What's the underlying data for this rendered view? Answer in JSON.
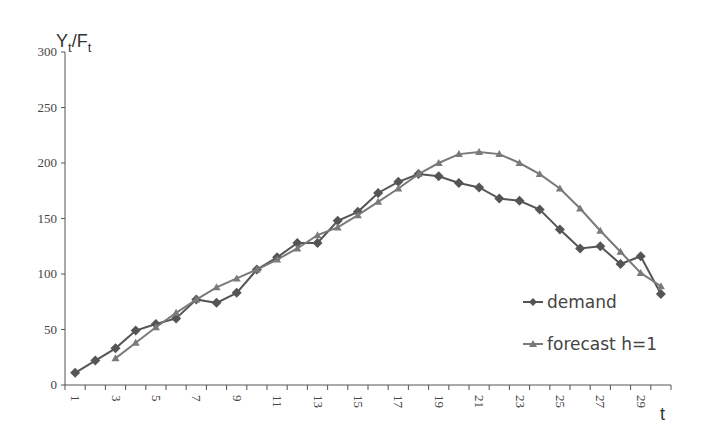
{
  "chart_data": {
    "type": "line",
    "title": "",
    "ylabel": "Y_t/F_t",
    "ylabel_main": "Y",
    "ylabel_sub1": "t",
    "ylabel_sep": "/F",
    "ylabel_sub2": "t",
    "xlabel": "t",
    "ylim": [
      0,
      300
    ],
    "yticks": [
      0,
      50,
      100,
      150,
      200,
      250,
      300
    ],
    "xticks_labeled": [
      1,
      3,
      5,
      7,
      9,
      11,
      13,
      15,
      17,
      19,
      21,
      23,
      25,
      27,
      29
    ],
    "x": [
      1,
      2,
      3,
      4,
      5,
      6,
      7,
      8,
      9,
      10,
      11,
      12,
      13,
      14,
      15,
      16,
      17,
      18,
      19,
      20,
      21,
      22,
      23,
      24,
      25,
      26,
      27,
      28,
      29,
      30
    ],
    "grid": false,
    "legend_position": "right-inside-bottom",
    "series": [
      {
        "name": "demand",
        "marker": "diamond",
        "color": "#555555",
        "values": [
          11,
          22,
          33,
          49,
          55,
          60,
          77,
          74,
          83,
          104,
          115,
          128,
          128,
          148,
          156,
          173,
          183,
          190,
          188,
          182,
          178,
          168,
          166,
          158,
          140,
          123,
          125,
          109,
          116,
          82
        ]
      },
      {
        "name": "forecast h=1",
        "marker": "triangle",
        "color": "#7a7a7a",
        "values": [
          null,
          null,
          24,
          38,
          52,
          65,
          77,
          88,
          96,
          104,
          113,
          123,
          135,
          142,
          153,
          165,
          177,
          190,
          200,
          208,
          210,
          208,
          200,
          190,
          177,
          159,
          139,
          120,
          101,
          89
        ]
      }
    ]
  }
}
